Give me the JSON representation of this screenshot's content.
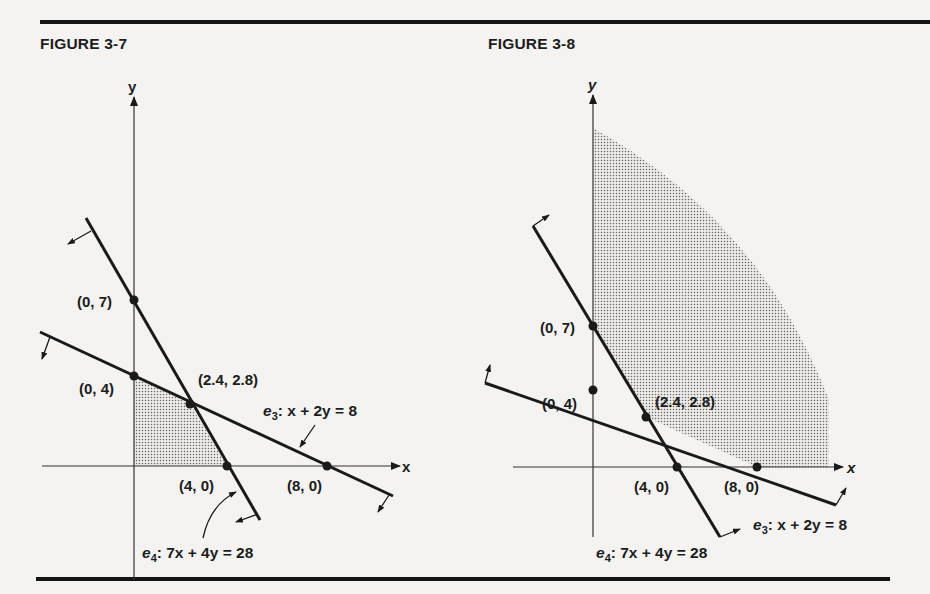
{
  "rules": {
    "top_y": 21,
    "bottom_y": 577
  },
  "figures": [
    {
      "title": "FIGURE 3-7",
      "axis_labels": {
        "x": "x",
        "y": "y"
      },
      "points": [
        {
          "label": "(0, 7)",
          "x": 0,
          "y": 7
        },
        {
          "label": "(0, 4)",
          "x": 0,
          "y": 4
        },
        {
          "label": "(2.4, 2.8)",
          "x": 2.4,
          "y": 2.8
        },
        {
          "label": "(4, 0)",
          "x": 4,
          "y": 0
        },
        {
          "label": "(8, 0)",
          "x": 8,
          "y": 0
        }
      ],
      "constraints": [
        {
          "name": "e3",
          "prefix": "e",
          "sub": "3",
          "equation": ": x + 2y = 8",
          "direction": "≤"
        },
        {
          "name": "e4",
          "prefix": "e",
          "sub": "4",
          "equation": ": 7x + 4y = 28",
          "direction": "≤"
        }
      ],
      "feasible_region": "bounded polygon (0,0),(0,4),(2.4,2.8),(4,0)"
    },
    {
      "title": "FIGURE 3-8",
      "axis_labels": {
        "x": "x",
        "y": "y"
      },
      "points": [
        {
          "label": "(0, 7)",
          "x": 0,
          "y": 7
        },
        {
          "label": "(0, 4)",
          "x": 0,
          "y": 4
        },
        {
          "label": "(2.4, 2.8)",
          "x": 2.4,
          "y": 2.8
        },
        {
          "label": "(4, 0)",
          "x": 4,
          "y": 0
        },
        {
          "label": "(8, 0)",
          "x": 8,
          "y": 0
        }
      ],
      "constraints": [
        {
          "name": "e3",
          "prefix": "e",
          "sub": "3",
          "equation": ": x + 2y = 8",
          "direction": "≥"
        },
        {
          "name": "e4",
          "prefix": "e",
          "sub": "4",
          "equation": ": 7x + 4y = 28",
          "direction": "≥"
        }
      ],
      "feasible_region": "unbounded region above (0,7),(2.4,2.8),(8,0)"
    }
  ],
  "colors": {
    "ink": "#1a1a1a",
    "paper": "#f4f3f1",
    "shade_dot": "#555555"
  }
}
